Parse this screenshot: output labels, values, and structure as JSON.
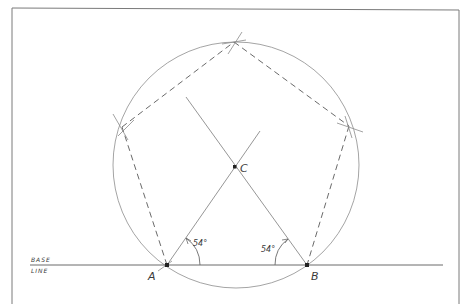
{
  "diagram": {
    "labels": {
      "base_line_top": "BASE",
      "base_line_bottom": "LINE",
      "point_a": "A",
      "point_b": "B",
      "point_c": "C",
      "angle_a": "54°",
      "angle_b": "54°"
    },
    "colors": {
      "line": "#8a8a8a",
      "dark_line": "#5a5a5a",
      "frame": "#7a7a7a",
      "point": "#222222"
    },
    "geometry": {
      "frame": {
        "x1": 12,
        "y1": 8,
        "x2": 459,
        "y2": 304
      },
      "base_line": {
        "x1": 30,
        "y1": 265,
        "x2": 443,
        "y2": 265
      },
      "point_a": {
        "x": 167,
        "y": 265
      },
      "point_b": {
        "x": 307,
        "y": 265
      },
      "center_c": {
        "x": 235,
        "y": 167
      },
      "circle": {
        "cx": 236,
        "cy": 165,
        "r": 123
      },
      "vertices": [
        {
          "name": "A",
          "x": 167,
          "y": 265
        },
        {
          "name": "left",
          "x": 122,
          "y": 127
        },
        {
          "name": "top",
          "x": 234,
          "y": 42
        },
        {
          "name": "right",
          "x": 349,
          "y": 126
        },
        {
          "name": "B",
          "x": 307,
          "y": 265
        }
      ],
      "angle_a_deg": 54,
      "angle_b_deg": 54
    }
  }
}
